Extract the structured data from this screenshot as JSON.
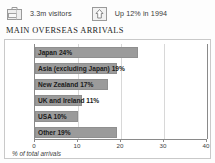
{
  "header": {
    "stats": [
      {
        "icon": "suitcase-icon",
        "label": "3.3m visitors"
      },
      {
        "icon": "up-arrow-icon",
        "label": "Up 12% in 1994"
      }
    ]
  },
  "title": "MAIN OVERSEAS ARRIVALS",
  "colors": {
    "bar_fill": "#9b9b9b",
    "bar_stroke": "#8f8f8f",
    "axis": "#8a8a8a",
    "gridline": "#d8d8d8",
    "panel_border": "#c9c9c9",
    "text": "#1a1a1a"
  },
  "chart_data": {
    "type": "bar",
    "orientation": "horizontal",
    "title": "MAIN OVERSEAS ARRIVALS",
    "xlabel": "% of total arrivals",
    "ylabel": "",
    "xlim": [
      0,
      40
    ],
    "xticks": [
      0,
      10,
      20,
      30,
      40
    ],
    "grid": true,
    "legend": false,
    "categories": [
      "Japan",
      "Asia (excluding Japan)",
      "New Zealand",
      "UK and Ireland",
      "USA",
      "Other"
    ],
    "values": [
      24,
      19,
      17,
      11,
      10,
      19
    ],
    "bar_labels": [
      "Japan 24%",
      "Asia (excluding Japan) 19%",
      "New Zealand 17%",
      "UK and Ireland 11%",
      "USA 10%",
      "Other 19%"
    ]
  },
  "axis_caption": "% of total arrivals"
}
